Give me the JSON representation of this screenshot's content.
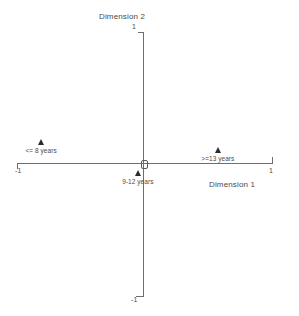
{
  "chart_data": {
    "type": "scatter",
    "title": "",
    "xlabel": "Dimension 1",
    "ylabel": "Dimension 2",
    "xlim": [
      -1,
      1
    ],
    "ylim": [
      -1,
      1
    ],
    "grid": false,
    "legend": "none",
    "axis_style": "crosshair",
    "x_ticks": [
      "-1",
      "1"
    ],
    "y_ticks": [
      "-1",
      "1"
    ],
    "points": [
      {
        "label": "<= 8 years",
        "x": -0.79,
        "y": 0.18
      },
      {
        "label": "9-12 years",
        "x": -0.04,
        "y": -0.05
      },
      {
        "label": ">=13 years",
        "x": 0.58,
        "y": 0.12
      }
    ],
    "origin_marker": {
      "label": "",
      "x": 0,
      "y": 0,
      "shape": "open-square"
    }
  },
  "axes": {
    "x_title": "Dimension 1",
    "y_title": "Dimension 2",
    "x_min_tick": "-1",
    "x_max_tick": "1",
    "y_min_tick": "-1",
    "y_max_tick": "1"
  },
  "points": {
    "p0": {
      "label": "<= 8 years"
    },
    "p1": {
      "label": "9-12 years"
    },
    "p2": {
      "label": ">=13 years"
    }
  },
  "colors": {
    "axis": "#6e6e6e",
    "marker": "#2b2b2b",
    "text": "#4a4a4a",
    "background": "#ffffff"
  }
}
